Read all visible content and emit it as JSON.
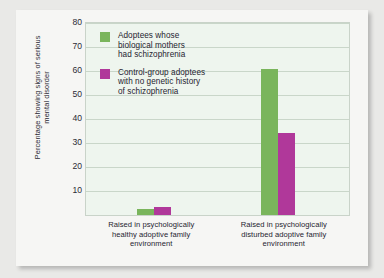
{
  "chart_data": {
    "type": "bar",
    "title": "",
    "xlabel": "",
    "ylabel": "Percentage showing signs of serious mental disorder",
    "ylim": [
      0,
      80
    ],
    "yticks": [
      10,
      20,
      30,
      40,
      50,
      60,
      70,
      80
    ],
    "grid": true,
    "legend_position": "top-left inside plot",
    "categories": [
      "Raised in psychologically healthy adoptive family environment",
      "Raised in psychologically disturbed adoptive family environment"
    ],
    "series": [
      {
        "name": "Adoptees whose biological mothers had schizophrenia",
        "color": "#7AB55C",
        "values": [
          2.5,
          61
        ]
      },
      {
        "name": "Control-group adoptees with no genetic history of schizophrenia",
        "color": "#B0389A",
        "values": [
          3.5,
          34
        ]
      }
    ]
  },
  "legend": {
    "items": [
      {
        "swatch_color": "#7AB55C",
        "lines": [
          "Adoptees whose",
          "biological mothers",
          "had schizophrenia"
        ]
      },
      {
        "swatch_color": "#B0389A",
        "lines": [
          "Control-group adoptees",
          "with no genetic history",
          "of schizophrenia"
        ]
      }
    ]
  },
  "axis": {
    "y_title": "Percentage showing signs of serious mental disorder",
    "y_tick_labels": [
      "80",
      "70",
      "60",
      "50",
      "40",
      "30",
      "20",
      "10"
    ],
    "x_tick_labels": [
      [
        "Raised in psychologically",
        "healthy adoptive family",
        "environment"
      ],
      [
        "Raised in psychologically",
        "disturbed adoptive family",
        "environment"
      ]
    ]
  },
  "colors": {
    "page_background": "#e9e9e7",
    "panel_background": "#f6f6f4",
    "plot_background": "#eef5ee",
    "gridline": "#c9d6c9",
    "text": "#1f2430",
    "series_green": "#7AB55C",
    "series_magenta": "#B0389A"
  }
}
